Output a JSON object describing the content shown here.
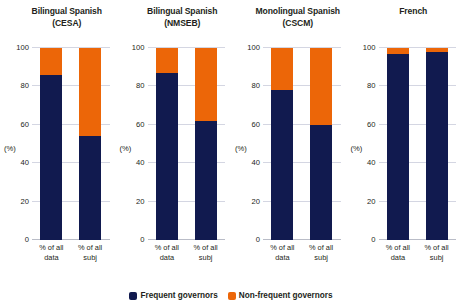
{
  "chart_data": {
    "type": "bar",
    "title": "",
    "subtitle": "",
    "xlabel": "",
    "ylabel": "(%)",
    "ylim": [
      0,
      100
    ],
    "yticks": [
      "0",
      "20",
      "40",
      "60",
      "80",
      "100"
    ],
    "ytick_values": [
      0,
      20,
      40,
      60,
      80,
      100
    ],
    "grid": true,
    "stacked": true,
    "legend_position": "bottom-center",
    "categories": [
      "% of all data",
      "% of all subj"
    ],
    "series": [
      {
        "name": "Frequent governors",
        "color": "#111a4f"
      },
      {
        "name": "Non-frequent governors",
        "color": "#ec6608"
      }
    ],
    "panels": [
      {
        "title_line1": "Bilingual Spanish",
        "title_line2": "(CESA)",
        "bars": [
          {
            "category_line1": "% of all",
            "category_line2": "data",
            "frequent": 86,
            "non_frequent": 14
          },
          {
            "category_line1": "% of all",
            "category_line2": "subj",
            "frequent": 54,
            "non_frequent": 46
          }
        ]
      },
      {
        "title_line1": "Bilingual Spanish",
        "title_line2": "(NMSEB)",
        "bars": [
          {
            "category_line1": "% of all",
            "category_line2": "data",
            "frequent": 87,
            "non_frequent": 13
          },
          {
            "category_line1": "% of all",
            "category_line2": "subj",
            "frequent": 62,
            "non_frequent": 38
          }
        ]
      },
      {
        "title_line1": "Monolingual Spanish",
        "title_line2": "(CSCM)",
        "bars": [
          {
            "category_line1": "% of all",
            "category_line2": "data",
            "frequent": 78,
            "non_frequent": 22
          },
          {
            "category_line1": "% of all",
            "category_line2": "subj",
            "frequent": 60,
            "non_frequent": 40
          }
        ]
      },
      {
        "title_line1": "French",
        "title_line2": "",
        "bars": [
          {
            "category_line1": "% of all",
            "category_line2": "data",
            "frequent": 97,
            "non_frequent": 3
          },
          {
            "category_line1": "% of all",
            "category_line2": "subj",
            "frequent": 98,
            "non_frequent": 2
          }
        ]
      }
    ]
  },
  "legend": {
    "items": [
      {
        "label": "Frequent governors",
        "color": "#111a4f"
      },
      {
        "label": "Non-frequent governors",
        "color": "#ec6608"
      }
    ]
  },
  "colors": {
    "frequent": "#111a4f",
    "non_frequent": "#ec6608",
    "grid": "#d4d6e2",
    "axis": "#b9bcc7",
    "text": "#231f20",
    "background": "#ffffff"
  }
}
